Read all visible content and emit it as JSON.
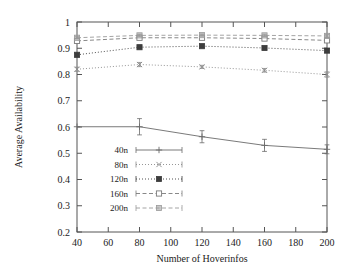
{
  "chart_data": {
    "type": "line",
    "title": "",
    "xlabel": "Number of Hoverinfos",
    "ylabel": "Average Availability",
    "x": [
      40,
      80,
      120,
      160,
      200
    ],
    "xlim": [
      40,
      200
    ],
    "ylim": [
      0.2,
      1.0
    ],
    "xticks": [
      40,
      60,
      80,
      100,
      120,
      140,
      160,
      180,
      200
    ],
    "yticks": [
      0.2,
      0.3,
      0.4,
      0.5,
      0.6,
      0.7,
      0.8,
      0.9,
      1
    ],
    "ytick_labels": [
      "0.2",
      "0.3",
      "0.4",
      "0.5",
      "0.6",
      "0.7",
      "0.8",
      "0.9",
      "1"
    ],
    "xtick_labels": [
      "40",
      "60",
      "80",
      "100",
      "120",
      "140",
      "160",
      "180",
      "200"
    ],
    "grid": false,
    "legend_position": "lower-left-inside",
    "series": [
      {
        "name": "40n",
        "values": [
          0.601,
          0.601,
          0.563,
          0.53,
          0.515
        ],
        "errors": [
          0.0,
          0.031,
          0.023,
          0.023,
          0.017
        ],
        "marker": "plus",
        "dash": "solid",
        "color": "#6b6b6b"
      },
      {
        "name": "80n",
        "values": [
          0.82,
          0.838,
          0.829,
          0.816,
          0.8
        ],
        "errors": [
          0.008,
          0.008,
          0.006,
          0.007,
          0.01
        ],
        "marker": "cross",
        "dash": "dotted",
        "color": "#8a8a8a"
      },
      {
        "name": "120n",
        "values": [
          0.875,
          0.904,
          0.908,
          0.901,
          0.891
        ],
        "errors": [
          0.006,
          0.006,
          0.005,
          0.006,
          0.007
        ],
        "marker": "filled-square",
        "dash": "dotted",
        "color": "#3d3d3d"
      },
      {
        "name": "160n",
        "values": [
          0.928,
          0.94,
          0.94,
          0.937,
          0.93
        ],
        "errors": [
          0.005,
          0.005,
          0.004,
          0.005,
          0.006
        ],
        "marker": "open-square",
        "dash": "dashed",
        "color": "#7a7a7a"
      },
      {
        "name": "200n",
        "values": [
          0.94,
          0.949,
          0.95,
          0.949,
          0.947
        ],
        "errors": [
          0.004,
          0.004,
          0.004,
          0.004,
          0.005
        ],
        "marker": "shaded-square",
        "dash": "dashed",
        "color": "#9a9a9a"
      }
    ]
  }
}
